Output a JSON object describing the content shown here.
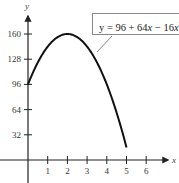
{
  "chart_data": {
    "type": "line",
    "title": "",
    "xlabel": "x",
    "ylabel": "y",
    "equation_label": "y = 96 + 64x − 16x²",
    "equation_parts": {
      "prefix": "y = 96 + 64",
      "x1": "x",
      "mid": " − 16",
      "x2": "x",
      "exp": "2"
    },
    "x_ticks": [
      1,
      2,
      3,
      4,
      5,
      6
    ],
    "y_ticks": [
      32,
      64,
      96,
      128,
      160
    ],
    "xlim": [
      -1,
      7
    ],
    "ylim": [
      -20,
      190
    ],
    "grid": false,
    "series": [
      {
        "name": "y = 96 + 64x − 16x^2",
        "x": [
          0,
          0.5,
          1,
          1.5,
          2,
          2.5,
          3,
          3.5,
          4,
          4.5,
          5
        ],
        "y": [
          96,
          124,
          144,
          156,
          160,
          156,
          144,
          124,
          96,
          60,
          16
        ]
      }
    ]
  }
}
